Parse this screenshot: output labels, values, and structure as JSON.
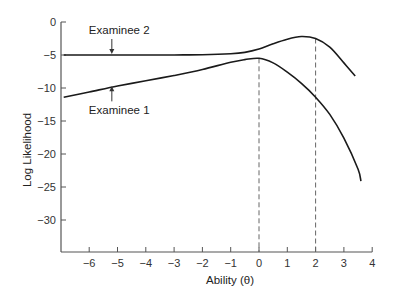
{
  "chart_data": {
    "type": "line",
    "title": "",
    "xlabel": "Ability (θ)",
    "ylabel": "Log Likelihood",
    "xlim": [
      -6.9,
      4
    ],
    "ylim": [
      -35,
      0
    ],
    "x_ticks": [
      -6,
      -5,
      -4,
      -3,
      -2,
      -1,
      0,
      1,
      2,
      3,
      4
    ],
    "x_tick_labels": [
      "−6",
      "−5",
      "−4",
      "−3",
      "−2",
      "−1",
      "0",
      "1",
      "2",
      "3",
      "4"
    ],
    "y_ticks": [
      0,
      -5,
      -10,
      -15,
      -20,
      -25,
      -30
    ],
    "y_tick_labels": [
      "0",
      "−5",
      "−10",
      "−15",
      "−20",
      "−25",
      "−30"
    ],
    "grid": false,
    "legend": "none (direct annotation with arrows)",
    "series": [
      {
        "name": "Examinee 1",
        "x": [
          -6.9,
          -6,
          -5,
          -4,
          -3,
          -2,
          -1,
          -0.5,
          0,
          0.5,
          1,
          1.5,
          2,
          2.5,
          3,
          3.5,
          3.6
        ],
        "values": [
          -11.4,
          -10.6,
          -9.7,
          -8.9,
          -8.1,
          -7.2,
          -6.1,
          -5.7,
          -5.5,
          -6.2,
          -7.6,
          -9.3,
          -11.4,
          -14.0,
          -17.6,
          -22.3,
          -24.1
        ],
        "peak_x": 0
      },
      {
        "name": "Examinee 2",
        "x": [
          -6.9,
          -6,
          -5,
          -4,
          -3,
          -2,
          -1,
          -0.5,
          0,
          0.5,
          1,
          1.5,
          2,
          2.5,
          3,
          3.4
        ],
        "values": [
          -5.0,
          -5.0,
          -5.0,
          -5.0,
          -5.0,
          -4.95,
          -4.8,
          -4.6,
          -4.1,
          -3.3,
          -2.6,
          -2.2,
          -2.5,
          -3.8,
          -6.2,
          -8.2
        ],
        "peak_x": 1.6
      }
    ],
    "reference_lines": [
      {
        "orientation": "vertical",
        "x": 0,
        "style": "dashed",
        "from_curve": "Examinee 1"
      },
      {
        "orientation": "vertical",
        "x": 2,
        "style": "dashed",
        "from_curve": "Examinee 2"
      }
    ],
    "annotations": [
      {
        "text": "Examinee 2",
        "arrow_to": {
          "x": -5.2,
          "y": -5.0
        },
        "position": "above"
      },
      {
        "text": "Examinee 1",
        "arrow_to": {
          "x": -5.2,
          "y": -9.6
        },
        "position": "below"
      }
    ],
    "colors": {
      "lines": "#1a1a1a",
      "axes": "#555555",
      "dashed": "#666666"
    }
  }
}
